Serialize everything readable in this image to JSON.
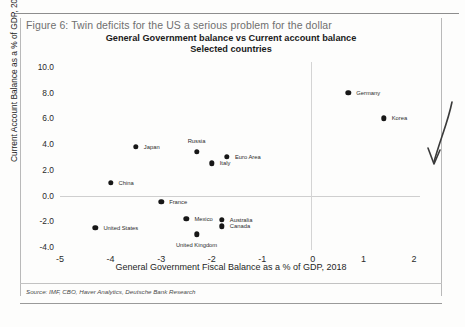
{
  "figure": {
    "caption": "Figure 6: Twin deficits for the US a serious problem for the dollar",
    "source": "Source: IMF, CBO, Haver Analytics, Deutsche Bank Research",
    "annotation_icon": "hand-drawn-curved-arrow"
  },
  "chart_data": {
    "type": "scatter",
    "title": "General Government balance vs Current account balance",
    "subtitle": "Selected countries",
    "xlabel": "General Government Fiscal Balance as a % of GDP, 2018",
    "ylabel": "Current Account Balance as a  % of GDP, 2018",
    "xlim": [
      -5,
      2
    ],
    "ylim": [
      -4.0,
      10.0
    ],
    "xticks": [
      "-5",
      "-4",
      "-3",
      "-2",
      "-1",
      "0",
      "1",
      "2"
    ],
    "xtick_values": [
      -5,
      -4,
      -3,
      -2,
      -1,
      0,
      1,
      2
    ],
    "yticks": [
      "10.0",
      "8.0",
      "6.0",
      "4.0",
      "2.0",
      "0.0",
      "-2.0",
      "-4.0"
    ],
    "ytick_values": [
      10.0,
      8.0,
      6.0,
      4.0,
      2.0,
      0.0,
      -2.0,
      -4.0
    ],
    "grid": "zero-lines-only",
    "legend": "none",
    "marker_color": "#171717",
    "points": [
      {
        "label": "Germany",
        "x": 0.7,
        "y": 8.0,
        "pos": "right"
      },
      {
        "label": "Korea",
        "x": 1.4,
        "y": 6.0,
        "pos": "right"
      },
      {
        "label": "Japan",
        "x": -3.5,
        "y": 3.8,
        "pos": "right"
      },
      {
        "label": "Russia",
        "x": -2.3,
        "y": 3.4,
        "pos": "above"
      },
      {
        "label": "Euro Area",
        "x": -1.7,
        "y": 3.0,
        "pos": "right"
      },
      {
        "label": "Italy",
        "x": -2.0,
        "y": 2.5,
        "pos": "right"
      },
      {
        "label": "China",
        "x": -4.0,
        "y": 1.0,
        "pos": "right"
      },
      {
        "label": "France",
        "x": -3.0,
        "y": -0.5,
        "pos": "right"
      },
      {
        "label": "Mexico",
        "x": -2.5,
        "y": -1.8,
        "pos": "right"
      },
      {
        "label": "Australia",
        "x": -1.8,
        "y": -1.9,
        "pos": "right"
      },
      {
        "label": "United States",
        "x": -4.3,
        "y": -2.5,
        "pos": "right"
      },
      {
        "label": "Canada",
        "x": -1.8,
        "y": -2.4,
        "pos": "right"
      },
      {
        "label": "United Kingdom",
        "x": -2.3,
        "y": -3.0,
        "pos": "below"
      }
    ]
  }
}
